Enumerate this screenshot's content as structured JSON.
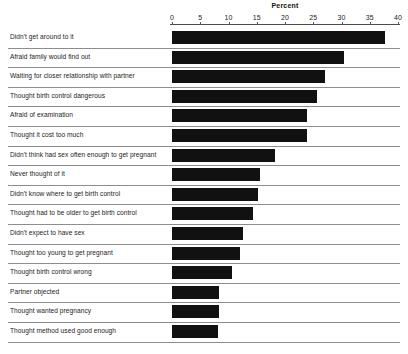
{
  "chart": {
    "title": "Percent",
    "axis": {
      "label": "Percent",
      "ticks": [
        0,
        5,
        10,
        15,
        20,
        25,
        30,
        35,
        40
      ],
      "min": 0,
      "max": 40
    },
    "bar_color": "#111111",
    "rule_color": "#8d8d8d"
  },
  "chart_data": {
    "type": "bar",
    "orientation": "horizontal",
    "title": "Percent",
    "xlabel": "Percent",
    "ylabel": "",
    "xlim": [
      0,
      40
    ],
    "xticks": [
      0,
      5,
      10,
      15,
      20,
      25,
      30,
      35,
      40
    ],
    "grid": false,
    "legend": null,
    "categories": [
      "Didn't get around to it",
      "Afraid family would find out",
      "Waiting for closer relationship with partner",
      "Thought birth control dangerous",
      "Afraid of examination",
      "Thought it cost too much",
      "Didn't think had sex often enough to get pregnant",
      "Never thought of it",
      "Didn't know where to get birth control",
      "Thought had to be older to get birth control",
      "Didn't expect to have sex",
      "Thought too young to get pregnant",
      "Thought birth control wrong",
      "Partner objected",
      "Thought wanted pregnancy",
      "Thought method used good enough"
    ],
    "values": [
      37.7,
      30.4,
      27.0,
      25.6,
      23.9,
      23.9,
      18.2,
      15.6,
      15.2,
      14.3,
      12.6,
      12.0,
      10.6,
      8.3,
      8.3,
      8.1
    ]
  }
}
